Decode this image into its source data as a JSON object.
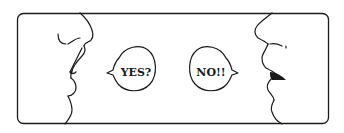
{
  "illustration": {
    "left_speaker": {
      "speech": "YES?"
    },
    "right_speaker": {
      "speech": "NO!!"
    }
  },
  "colors": {
    "ink": "#1a1a1a",
    "background": "#ffffff"
  }
}
